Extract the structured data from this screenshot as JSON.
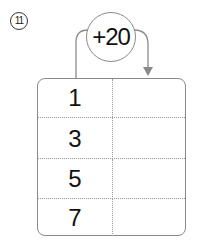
{
  "problem": {
    "number_label": "11",
    "operation": "+20",
    "rows": [
      {
        "input": "1",
        "output": ""
      },
      {
        "input": "3",
        "output": ""
      },
      {
        "input": "5",
        "output": ""
      },
      {
        "input": "7",
        "output": ""
      }
    ]
  },
  "colors": {
    "border": "#8a8a8a",
    "text": "#111111"
  }
}
